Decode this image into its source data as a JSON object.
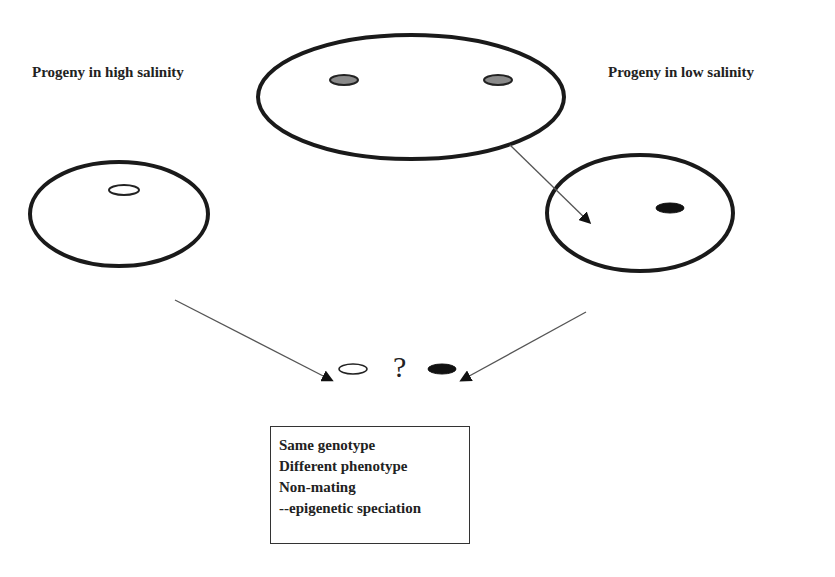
{
  "labels": {
    "high_salinity": "Progeny in high salinity",
    "low_salinity": "Progeny in low salinity",
    "question_mark": "?"
  },
  "parent_culture": {
    "cells": [
      "grey",
      "grey"
    ]
  },
  "high_salinity_culture": {
    "cell": "white"
  },
  "low_salinity_culture": {
    "cell": "black"
  },
  "comparison": {
    "left_cell": "white",
    "right_cell": "black"
  },
  "note": {
    "lines": [
      "Same genotype",
      "Different phenotype",
      "Non-mating",
      "--epigenetic speciation"
    ]
  },
  "colors": {
    "outline": "#1a1a1a",
    "grey_cell": "#8a8a8a",
    "black_cell": "#111111",
    "arrow": "#555555"
  }
}
